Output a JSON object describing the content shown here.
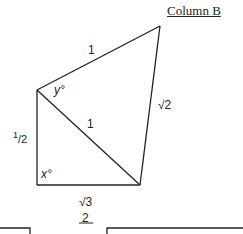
{
  "header": {
    "column_title": "Column B"
  },
  "figure": {
    "labels": {
      "top_edge": "1",
      "diagonal": "1",
      "right_edge": "√2",
      "left_edge_num": "1",
      "left_edge_den": "2",
      "bottom_edge_num": "√3",
      "bottom_edge_den": "2",
      "angle_y": "y°",
      "angle_x": "x°"
    }
  }
}
